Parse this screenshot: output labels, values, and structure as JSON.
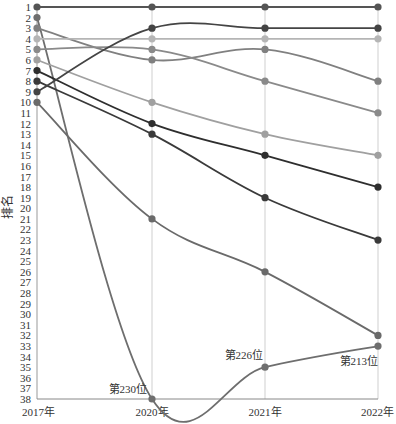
{
  "chart_data": {
    "type": "line",
    "title": "",
    "xlabel": "",
    "ylabel": "排名",
    "x": [
      "2017年",
      "2020年",
      "2021年",
      "2022年"
    ],
    "y_ticks": [
      1,
      2,
      3,
      4,
      5,
      6,
      7,
      8,
      9,
      10,
      11,
      12,
      13,
      14,
      15,
      16,
      17,
      18,
      19,
      20,
      21,
      22,
      23,
      24,
      25,
      26,
      27,
      28,
      29,
      30,
      31,
      32,
      33,
      34,
      35,
      36,
      37,
      38
    ],
    "ylim": [
      1,
      38
    ],
    "y_inverted": true,
    "grid": "vertical lines at each year",
    "legend": "none",
    "series": [
      {
        "name": "series-1",
        "values": [
          1,
          1,
          1,
          1
        ],
        "color": "#555555"
      },
      {
        "name": "series-2",
        "values": [
          2,
          38,
          35,
          33
        ],
        "color": "#6e6e6e"
      },
      {
        "name": "series-3",
        "values": [
          3,
          6,
          5,
          8
        ],
        "color": "#808080"
      },
      {
        "name": "series-4",
        "values": [
          4,
          4,
          4,
          4
        ],
        "color": "#b5b5b5"
      },
      {
        "name": "series-5",
        "values": [
          5,
          5,
          8,
          11
        ],
        "color": "#8a8a8a"
      },
      {
        "name": "series-6",
        "values": [
          6,
          10,
          13,
          15
        ],
        "color": "#a0a0a0"
      },
      {
        "name": "series-7",
        "values": [
          7,
          12,
          15,
          18
        ],
        "color": "#2e2e2e"
      },
      {
        "name": "series-8",
        "values": [
          8,
          13,
          19,
          23
        ],
        "color": "#3a3a3a"
      },
      {
        "name": "series-9",
        "values": [
          9,
          3,
          3,
          3
        ],
        "color": "#444444"
      },
      {
        "name": "series-10",
        "values": [
          10,
          21,
          26,
          32
        ],
        "color": "#6a6a6a"
      }
    ],
    "annotations": [
      {
        "text": "第230位",
        "x": "2020年",
        "y": 38
      },
      {
        "text": "第226位",
        "x": "2021年",
        "y": 35
      },
      {
        "text": "第213位",
        "x": "2022年",
        "y": 33
      }
    ]
  }
}
